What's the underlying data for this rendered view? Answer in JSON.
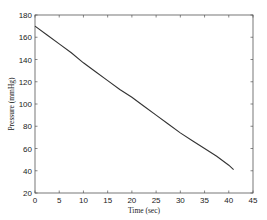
{
  "chart_data": {
    "type": "line",
    "title": "",
    "xlabel": "Time (sec)",
    "ylabel": "Pressure (mmHg)",
    "xlim": [
      0,
      45
    ],
    "ylim": [
      20,
      180
    ],
    "xticks": [
      0,
      5,
      10,
      15,
      20,
      25,
      30,
      35,
      40,
      45
    ],
    "yticks": [
      20,
      40,
      60,
      80,
      100,
      120,
      140,
      160,
      180
    ],
    "grid": false,
    "legend": null,
    "series": [
      {
        "name": "Pressure",
        "color": "#333333",
        "x": [
          0,
          2.5,
          5,
          7.5,
          10,
          12.5,
          15,
          17.5,
          20,
          22.5,
          25,
          27.5,
          30,
          32.5,
          35,
          37.5,
          40,
          41
        ],
        "y": [
          170,
          162,
          154,
          146,
          137,
          129,
          121,
          113,
          106,
          98,
          90,
          82,
          74,
          67,
          60,
          53,
          45,
          41
        ]
      }
    ]
  },
  "plot": {
    "left": 35,
    "right": 253,
    "top": 15,
    "bottom": 193
  }
}
